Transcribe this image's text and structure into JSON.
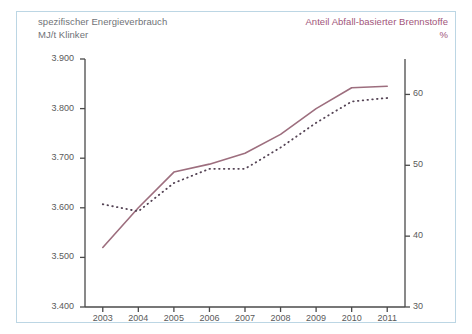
{
  "header": {
    "left_title_line1": "spezifischer Energieverbrauch",
    "left_title_line2": "MJ/t Klinker",
    "right_title_line1": "Anteil Abfall-basierter Brennstoffe",
    "right_title_line2": "%",
    "left_color": "#6f7277",
    "right_color": "#a1557a"
  },
  "colors": {
    "frame_border": "#bcd6e4",
    "axis": "#4a4a4a",
    "line_energy": "#9d6e7e",
    "line_share": "#554455",
    "tick_text": "#5a5a5a",
    "background": "#ffffff"
  },
  "axes": {
    "y_left_ticks": [
      "3.900",
      "3.800",
      "3.700",
      "3.600",
      "3.500",
      "3.400"
    ],
    "y_right_ticks": [
      "60",
      "50",
      "40",
      "30"
    ],
    "x_ticks": [
      "2003",
      "2004",
      "2005",
      "2006",
      "2007",
      "2008",
      "2009",
      "2010",
      "2011"
    ]
  },
  "chart_data": {
    "type": "line",
    "title": "",
    "subtitle": "",
    "xlabel": "",
    "ylabel": "MJ/t Klinker",
    "y2label": "%",
    "grid": false,
    "legend": "none",
    "x": [
      2003,
      2004,
      2005,
      2006,
      2007,
      2008,
      2009,
      2010,
      2011
    ],
    "ylim": [
      3400,
      3900
    ],
    "y2lim": [
      30,
      65
    ],
    "series": [
      {
        "name": "spezifischer Energieverbrauch MJ/t Klinker",
        "axis": "left",
        "style": "solid",
        "color": "#9d6e7e",
        "values": [
          3520,
          3600,
          3672,
          3688,
          3710,
          3748,
          3800,
          3842,
          3845
        ]
      },
      {
        "name": "Anteil Abfall-basierter Brennstoffe %",
        "axis": "right",
        "style": "dotted",
        "color": "#554455",
        "values": [
          44.5,
          43.5,
          47.5,
          49.5,
          49.5,
          52.5,
          56.0,
          59.0,
          59.5
        ]
      }
    ]
  }
}
